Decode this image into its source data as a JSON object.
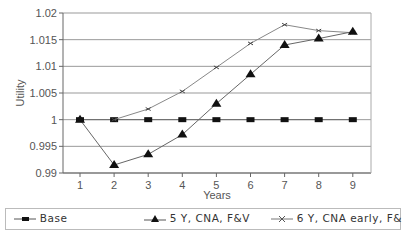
{
  "chart_data": {
    "type": "line",
    "title": "",
    "xlabel": "Years",
    "ylabel": "Utility",
    "x": [
      1,
      2,
      3,
      4,
      5,
      6,
      7,
      8,
      9
    ],
    "ylim": [
      0.99,
      1.02
    ],
    "yticks": [
      "0.99",
      "0.995",
      "1",
      "1.005",
      "1.01",
      "1.015",
      "1.02"
    ],
    "xticks": [
      "1",
      "2",
      "3",
      "4",
      "5",
      "6",
      "7",
      "8",
      "9"
    ],
    "grid": "horizontal",
    "legend_position": "bottom",
    "series": [
      {
        "name": "Base",
        "marker": "square",
        "values": [
          1.0,
          1.0,
          1.0,
          1.0,
          1.0,
          1.0,
          1.0,
          1.0,
          1.0
        ]
      },
      {
        "name": "5 Y,  CNA,  F&V",
        "marker": "triangle",
        "values": [
          1.0,
          0.9915,
          0.9935,
          0.9972,
          1.003,
          1.0085,
          1.014,
          1.0152,
          1.0165
        ]
      },
      {
        "name": "6 Y,  CNA early,  F&",
        "marker": "x",
        "values": [
          null,
          1.0,
          1.002,
          1.0053,
          1.0098,
          1.0143,
          1.0178,
          1.0167,
          1.0163
        ]
      }
    ]
  },
  "legend": {
    "base": "Base",
    "s5y": "5 Y,  CNA,  F&V",
    "s6y": "6 Y,  CNA early,  F&"
  }
}
